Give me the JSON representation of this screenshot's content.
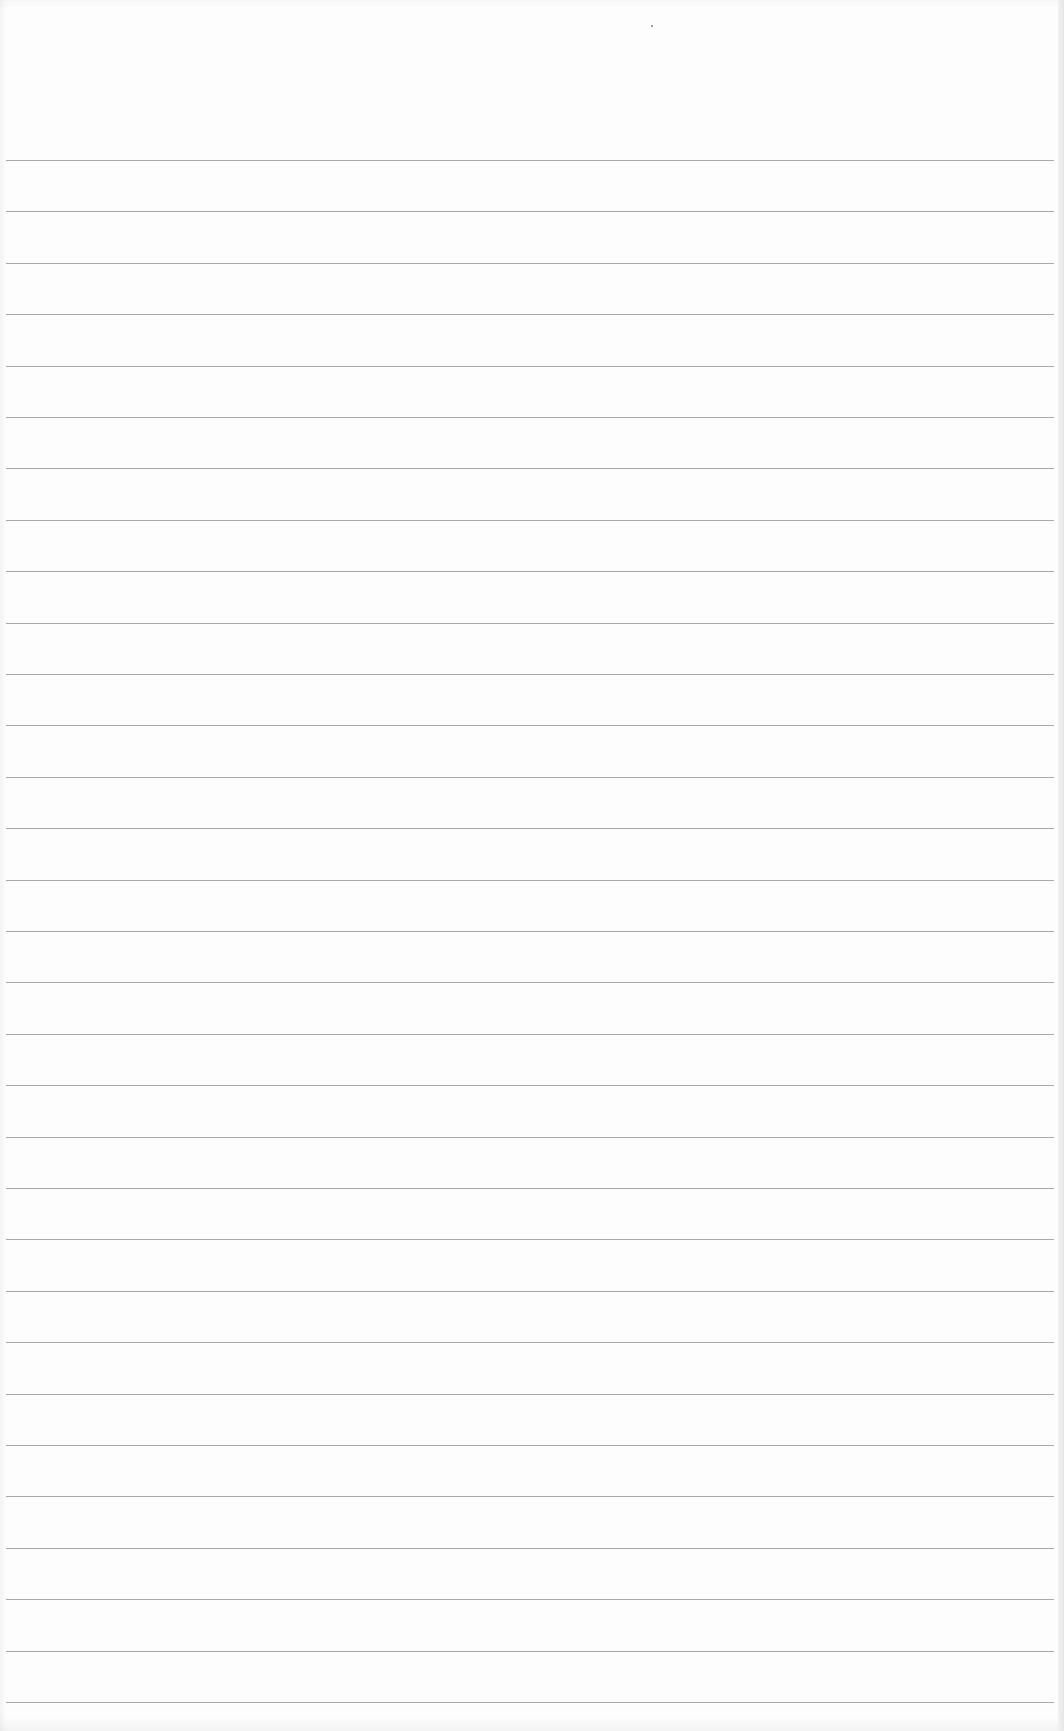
{
  "page": {
    "type": "lined-paper",
    "paper_color": "#fdfdfd",
    "background_color": "#ececec",
    "rule_color": "#9a9a9a",
    "rule_count": 31,
    "first_rule_y": 160,
    "rule_spacing": 51.4,
    "text_content": []
  }
}
